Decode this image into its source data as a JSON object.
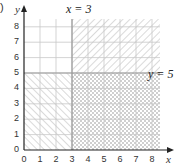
{
  "part_label": ")",
  "chart_data": {
    "type": "region",
    "title": "",
    "xlabel": "x",
    "ylabel": "y",
    "xlim": [
      0,
      8.5
    ],
    "ylim": [
      0,
      8.5
    ],
    "x_ticks": [
      0,
      1,
      2,
      3,
      4,
      5,
      6,
      7,
      8
    ],
    "y_ticks": [
      0,
      1,
      2,
      3,
      4,
      5,
      6,
      7,
      8
    ],
    "grid": true,
    "lines": [
      {
        "label": "x = 3",
        "orientation": "vertical",
        "value": 3
      },
      {
        "label": "y = 5",
        "orientation": "horizontal",
        "value": 5
      }
    ],
    "regions": [
      {
        "name": "x>=3 and y>=5",
        "x": [
          3,
          8.5
        ],
        "y": [
          5,
          8.5
        ],
        "shading": "forward-diagonal"
      },
      {
        "name": "x<=3 and y<=5",
        "x": [
          0,
          3
        ],
        "y": [
          0,
          5
        ],
        "shading": "back-diagonal"
      },
      {
        "name": "x>=3 and y<=5",
        "x": [
          3,
          8.5
        ],
        "y": [
          0,
          5
        ],
        "shading": "cross-hatch"
      },
      {
        "name": "x<=3 and y>=5",
        "x": [
          0,
          3
        ],
        "y": [
          5,
          8.5
        ],
        "shading": "none"
      }
    ],
    "colors": {
      "grid": "#c8c8c8",
      "hatch": "#b0b0b0",
      "axis": "#222222",
      "boundary": "#999999"
    }
  }
}
